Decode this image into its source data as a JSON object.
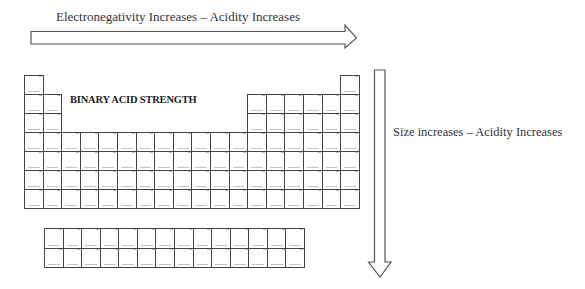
{
  "diagram": {
    "title": "BINARY ACID STRENGTH",
    "horizontal_arrow": {
      "label": "Electronegativity Increases – Acidity Increases",
      "direction": "right"
    },
    "vertical_arrow": {
      "label": "Size increases – Acidity Increases",
      "direction": "down"
    },
    "periodic_table": {
      "main_columns": 18,
      "main_rows": 7,
      "f_block_columns": 14,
      "f_block_rows": 2,
      "cell_text_legible": false
    },
    "colors": {
      "line": "#444444",
      "text": "#333333",
      "background": "#ffffff"
    }
  }
}
